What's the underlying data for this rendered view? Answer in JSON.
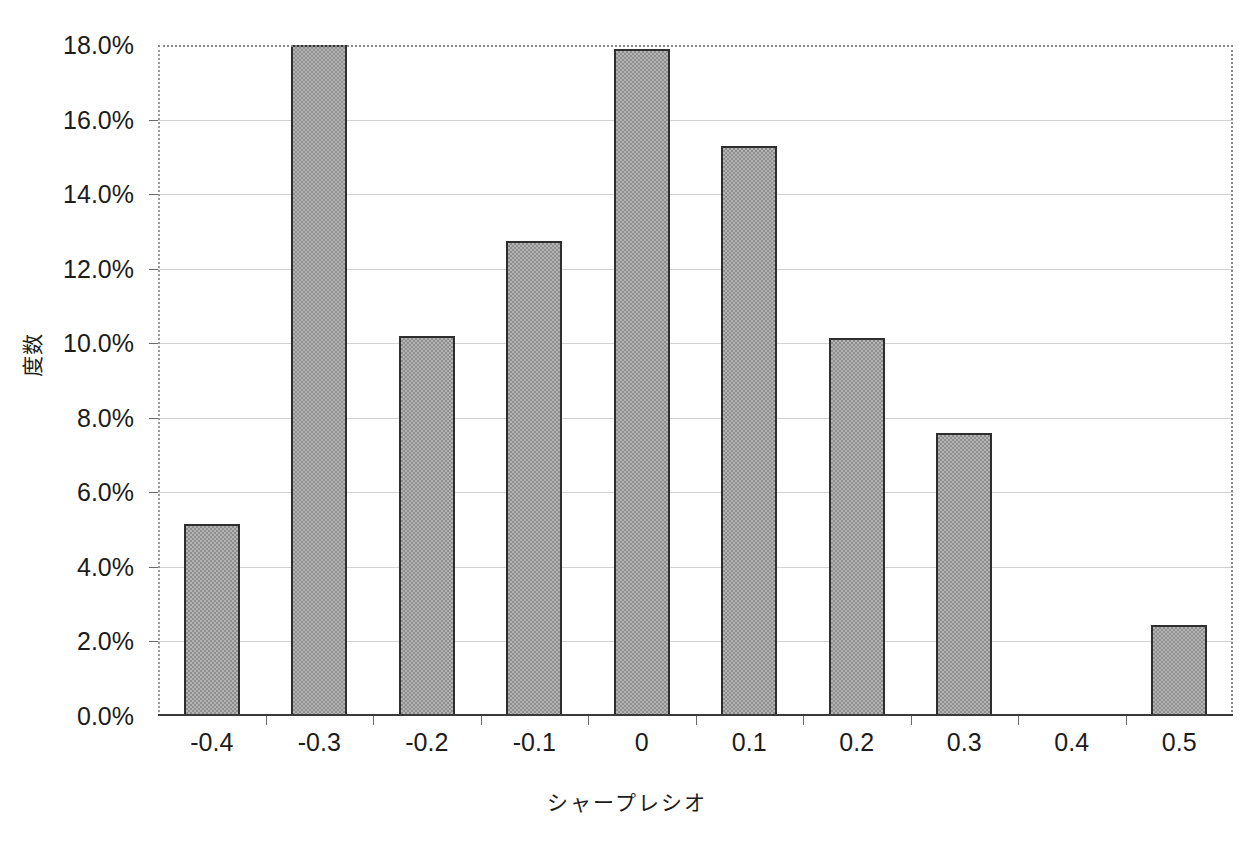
{
  "top_caption": "",
  "chart_data": {
    "type": "bar",
    "title": "",
    "subtitle": "",
    "xlabel": "シャープレシオ",
    "ylabel": "度数",
    "categories": [
      "-0.4",
      "-0.3",
      "-0.2",
      "-0.1",
      "0",
      "0.1",
      "0.2",
      "0.3",
      "0.4",
      "0.5"
    ],
    "values": [
      5.15,
      18.0,
      10.2,
      12.75,
      17.9,
      15.3,
      10.15,
      7.6,
      0.0,
      2.45
    ],
    "value_unit": "%",
    "ylim": [
      0,
      18
    ],
    "ytick_values": [
      0,
      2,
      4,
      6,
      8,
      10,
      12,
      14,
      16,
      18
    ],
    "ytick_labels": [
      "0.0%",
      "2.0%",
      "4.0%",
      "6.0%",
      "8.0%",
      "10.0%",
      "12.0%",
      "14.0%",
      "16.0%",
      "18.0%"
    ],
    "grid": true,
    "grid_axis": "y",
    "legend": false,
    "legend_position": "none",
    "bar_fill_color": "#b4b4b4",
    "bar_pattern": "checkerboard-dither",
    "bar_border_color": "#2e2e2e",
    "gridline_color": "#d2d2d2",
    "plot_border_color": "#8a8a8a",
    "axis_color": "#3a3a3a",
    "background_color": "#ffffff",
    "annotations": []
  }
}
